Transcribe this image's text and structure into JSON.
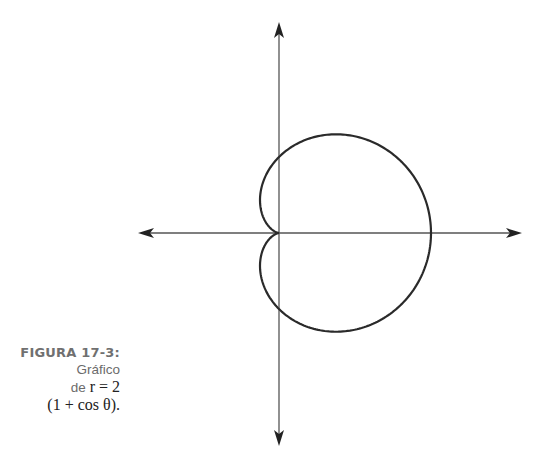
{
  "caption": {
    "label": "FIGURA 17-3:",
    "line1": "Gráfico",
    "line2_prefix": "de ",
    "line2_math": "r = 2",
    "line3_math": "(1 + cos θ)."
  },
  "colors": {
    "curve": "#2a2a2a",
    "axes": "#555555",
    "caption": "#6b6b6b"
  },
  "chart_data": {
    "type": "line",
    "equation": "r = 2(1 + cos θ)",
    "coordinate_system": "polar",
    "xlabel": "",
    "ylabel": "",
    "xlim": [
      -3.74,
      6.36
    ],
    "ylim": [
      -5.61,
      5.55
    ],
    "grid": false,
    "legend": null,
    "axes_arrows": true,
    "key_points": [
      {
        "theta": "0",
        "r": 4,
        "x": 4,
        "y": 0
      },
      {
        "theta": "π/2",
        "r": 2,
        "x": 0,
        "y": 2
      },
      {
        "theta": "π",
        "r": 0,
        "x": 0,
        "y": 0
      },
      {
        "theta": "3π/2",
        "r": 2,
        "x": 0,
        "y": -2
      }
    ],
    "pixel_mapping": {
      "origin_x": 279,
      "origin_y": 233,
      "px_per_unit": 38
    }
  }
}
